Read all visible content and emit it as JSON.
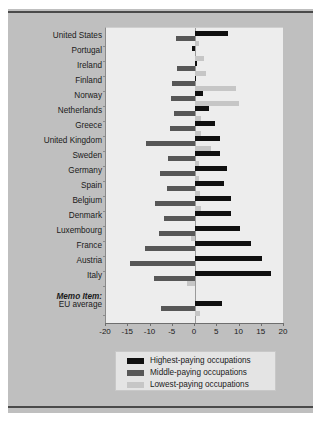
{
  "chart_data": {
    "type": "bar",
    "orientation": "horizontal",
    "title": "",
    "subtitle": "",
    "xlabel": "",
    "ylabel": "",
    "xlim": [
      -20,
      20
    ],
    "xticks": [
      -20,
      -15,
      -10,
      -5,
      0,
      5,
      10,
      15,
      20
    ],
    "xtick_labels": [
      "-20",
      "-15",
      "-10",
      "-5",
      "0",
      "5",
      "10",
      "15",
      "20"
    ],
    "grid": false,
    "legend_position": "bottom",
    "categories": [
      "United States",
      "Portugal",
      "Ireland",
      "Finland",
      "Norway",
      "Netherlands",
      "Greece",
      "United Kingdom",
      "Sweden",
      "Germany",
      "Spain",
      "Belgium",
      "Denmark",
      "Luxembourg",
      "France",
      "Austria",
      "Italy",
      "EU average"
    ],
    "memo_label": "Memo Item:",
    "memo_category": "EU average",
    "series": [
      {
        "name": "Highest-paying occupations",
        "color": "#101010",
        "values": [
          7.5,
          -0.6,
          0.4,
          0.3,
          1.7,
          3.1,
          4.6,
          5.6,
          5.6,
          7.1,
          6.6,
          8.0,
          8.0,
          10.2,
          12.6,
          15.1,
          17.0,
          6.1
        ]
      },
      {
        "name": "Middle-paying occupations",
        "color": "#575757",
        "values": [
          -4.2,
          0.0,
          -4.0,
          -5.2,
          -5.3,
          -4.8,
          -5.6,
          -11.0,
          -6.0,
          -7.8,
          -6.3,
          -9.0,
          -7.0,
          -8.0,
          -11.2,
          -14.6,
          -9.2,
          -7.6
        ]
      },
      {
        "name": "Lowest-paying occupations",
        "color": "#c6c6c6",
        "values": [
          1.0,
          2.0,
          2.5,
          9.3,
          9.9,
          1.4,
          1.3,
          3.6,
          1.0,
          0.9,
          1.1,
          1.3,
          0.0,
          -1.0,
          0.0,
          0.0,
          -1.8,
          1.1
        ]
      }
    ]
  },
  "legend": {
    "items": [
      {
        "label": "Highest-paying occupations",
        "color": "#101010"
      },
      {
        "label": "Middle-paying occupations",
        "color": "#575757"
      },
      {
        "label": "Lowest-paying occupations",
        "color": "#c6c6c6"
      }
    ]
  },
  "colors": {
    "panel_background": "#bfbfbf",
    "plot_background": "#ededed",
    "legend_background": "#e4e4e4",
    "rule": "#4a4a4a",
    "axis": "#6e6e6e"
  }
}
